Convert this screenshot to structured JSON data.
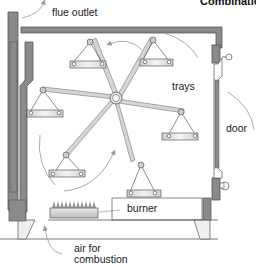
{
  "title": "Combination",
  "labels": {
    "flue_outlet": "flue outlet",
    "trays": "trays",
    "door": "door",
    "burner": "burner",
    "air_line1": "air for",
    "air_line2": "combustion"
  },
  "colors": {
    "wall": "#8a8a8a",
    "wall_outline": "#555555",
    "line": "#444444",
    "arm": "#d4d4d4",
    "tray": "#e2e2e2",
    "burner": "#dcdcdc",
    "flame": "#9a9a9a"
  },
  "components": [
    "flue-outlet",
    "oven-wall",
    "rotating-reel",
    "trays",
    "door",
    "burner",
    "air-inlet"
  ]
}
